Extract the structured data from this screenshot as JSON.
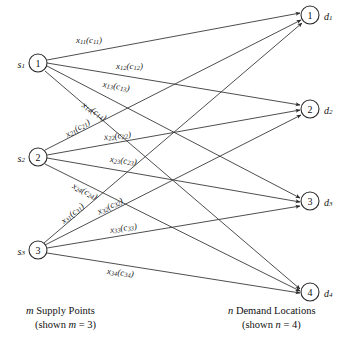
{
  "figure": {
    "type": "bipartite-transportation-network",
    "background": "#ffffff",
    "edge_color": "#3a3a3a",
    "node_stroke": "#2b2b2b",
    "text_color": "#111111",
    "width": 353,
    "height": 343
  },
  "supply": {
    "caption_line1_italic": "m",
    "caption_line1_rest": " Supply Points",
    "caption_line2_pre": "(shown ",
    "caption_line2_italic": "m",
    "caption_line2_post": " = 3)",
    "count": 3,
    "nodes": [
      {
        "id": "s1",
        "number": "1",
        "label_base": "s",
        "label_sub": "1",
        "cx": 38,
        "cy": 63,
        "r": 9
      },
      {
        "id": "s2",
        "number": "2",
        "label_base": "s",
        "label_sub": "2",
        "cx": 38,
        "cy": 157,
        "r": 9
      },
      {
        "id": "s3",
        "number": "3",
        "label_base": "s",
        "label_sub": "3",
        "cx": 38,
        "cy": 250,
        "r": 9
      }
    ]
  },
  "demand": {
    "caption_line1_italic": "n",
    "caption_line1_rest": " Demand Locations",
    "caption_line2_pre": "(shown ",
    "caption_line2_italic": "n",
    "caption_line2_post": " = 4)",
    "count": 4,
    "nodes": [
      {
        "id": "d1",
        "number": "1",
        "label_base": "d",
        "label_sub": "1",
        "cx": 310,
        "cy": 15,
        "r": 9
      },
      {
        "id": "d2",
        "number": "2",
        "label_base": "d",
        "label_sub": "2",
        "cx": 310,
        "cy": 109,
        "r": 9
      },
      {
        "id": "d3",
        "number": "3",
        "label_base": "d",
        "label_sub": "3",
        "cx": 310,
        "cy": 201,
        "r": 9
      },
      {
        "id": "d4",
        "number": "4",
        "label_base": "d",
        "label_sub": "4",
        "cx": 310,
        "cy": 292,
        "r": 9
      }
    ]
  },
  "edges": [
    {
      "id": "e11",
      "from": "s1",
      "to": "d1",
      "x1": 47,
      "y1": 60,
      "x2": 300,
      "y2": 13,
      "label_x": "x",
      "label_xsub": "11",
      "label_c": "c",
      "label_csub": "11",
      "lx": 76,
      "ly": 40,
      "rot": 0
    },
    {
      "id": "e12",
      "from": "s1",
      "to": "d2",
      "x1": 47,
      "y1": 63,
      "x2": 300,
      "y2": 105,
      "label_x": "x",
      "label_xsub": "12",
      "label_c": "c",
      "label_csub": "12",
      "lx": 116,
      "ly": 66,
      "rot": 0
    },
    {
      "id": "e13",
      "from": "s1",
      "to": "d3",
      "x1": 47,
      "y1": 66,
      "x2": 300,
      "y2": 198,
      "label_x": "x",
      "label_xsub": "13",
      "label_c": "c",
      "label_csub": "13",
      "lx": 103,
      "ly": 84,
      "rot": 9
    },
    {
      "id": "e14",
      "from": "s1",
      "to": "d4",
      "x1": 45,
      "y1": 71,
      "x2": 300,
      "y2": 289,
      "label_x": "x",
      "label_xsub": "14",
      "label_c": "c",
      "label_csub": "14",
      "lx": 83,
      "ly": 104,
      "rot": 32
    },
    {
      "id": "e21",
      "from": "s2",
      "to": "d1",
      "x1": 45,
      "y1": 150,
      "x2": 301,
      "y2": 20,
      "label_x": "x",
      "label_xsub": "21",
      "label_c": "c",
      "label_csub": "21",
      "lx": 66,
      "ly": 135,
      "rot": -31
    },
    {
      "id": "e22",
      "from": "s2",
      "to": "d2",
      "x1": 47,
      "y1": 155,
      "x2": 300,
      "y2": 110,
      "label_x": "x",
      "label_xsub": "22",
      "label_c": "c",
      "label_csub": "22",
      "lx": 104,
      "ly": 137,
      "rot": -6
    },
    {
      "id": "e23",
      "from": "s2",
      "to": "d3",
      "x1": 47,
      "y1": 158,
      "x2": 300,
      "y2": 202,
      "label_x": "x",
      "label_xsub": "23",
      "label_c": "c",
      "label_csub": "23",
      "lx": 110,
      "ly": 159,
      "rot": 6
    },
    {
      "id": "e24",
      "from": "s2",
      "to": "d4",
      "x1": 45,
      "y1": 164,
      "x2": 300,
      "y2": 291,
      "label_x": "x",
      "label_xsub": "24",
      "label_c": "c",
      "label_csub": "24",
      "lx": 73,
      "ly": 185,
      "rot": 27
    },
    {
      "id": "e31",
      "from": "s3",
      "to": "d1",
      "x1": 44,
      "y1": 243,
      "x2": 302,
      "y2": 23,
      "label_x": "x",
      "label_xsub": "31",
      "label_c": "c",
      "label_csub": "31",
      "lx": 62,
      "ly": 222,
      "rot": -40
    },
    {
      "id": "e32",
      "from": "s3",
      "to": "d2",
      "x1": 45,
      "y1": 245,
      "x2": 301,
      "y2": 115,
      "label_x": "x",
      "label_xsub": "32",
      "label_c": "c",
      "label_csub": "32",
      "lx": 98,
      "ly": 212,
      "rot": -27
    },
    {
      "id": "e33",
      "from": "s3",
      "to": "d3",
      "x1": 47,
      "y1": 248,
      "x2": 300,
      "y2": 206,
      "label_x": "x",
      "label_xsub": "33",
      "label_c": "c",
      "label_csub": "33",
      "lx": 110,
      "ly": 230,
      "rot": -9
    },
    {
      "id": "e34",
      "from": "s3",
      "to": "d4",
      "x1": 47,
      "y1": 253,
      "x2": 300,
      "y2": 293,
      "label_x": "x",
      "label_xsub": "34",
      "label_c": "c",
      "label_csub": "34",
      "lx": 107,
      "ly": 271,
      "rot": 6
    }
  ]
}
